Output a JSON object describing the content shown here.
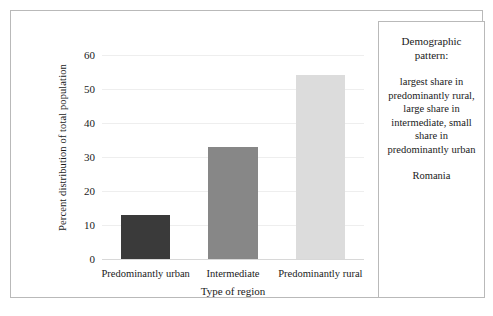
{
  "chart_data": {
    "type": "bar",
    "title": "",
    "categories": [
      "Predominantly urban",
      "Intermediate",
      "Predominantly rural"
    ],
    "values": [
      13,
      33,
      54
    ],
    "series": [
      {
        "name": "Percent distribution of total population",
        "values": [
          13,
          33,
          54
        ],
        "colors": [
          "#3a3a3a",
          "#878787",
          "#dcdcdc"
        ]
      }
    ],
    "xlabel": "Type of region",
    "ylabel": "Percent distribution of total population",
    "ylim": [
      0,
      60
    ],
    "yticks": [
      0,
      10,
      20,
      30,
      40,
      50,
      60
    ],
    "ytick_labels": [
      "0",
      "10",
      "20",
      "30",
      "40",
      "50",
      "60"
    ],
    "grid": true,
    "legend": "none"
  },
  "info_panel": {
    "heading": "Demographic\npattern:",
    "body": "largest share in predominantly rural, large share in intermediate, small share in predominantly urban",
    "country": "Romania"
  },
  "colors": {
    "bar_urban": "#3a3a3a",
    "bar_intermediate": "#878787",
    "bar_rural": "#dcdcdc",
    "frame_border": "#b9b9b9",
    "gridline": "#eeeeee"
  }
}
